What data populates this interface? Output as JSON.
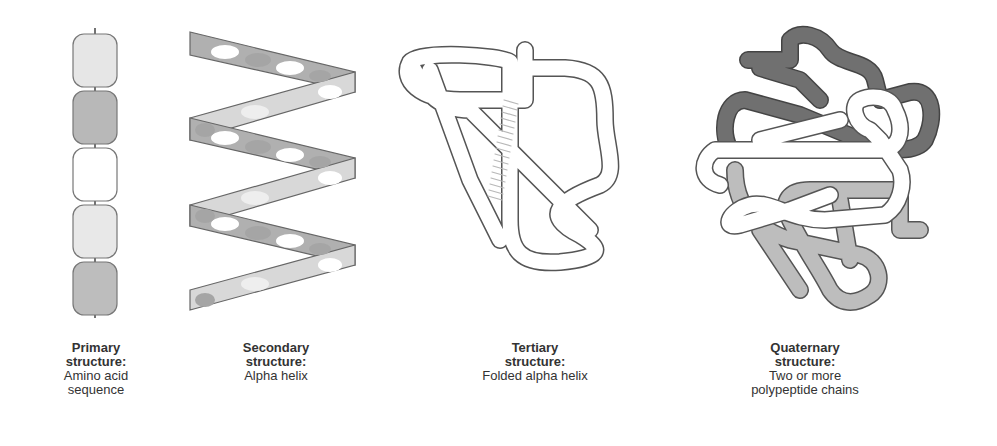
{
  "figure": {
    "panels": [
      {
        "id": "primary",
        "title_line1": "Primary",
        "title_line2": "structure:",
        "desc_line1": "Amino acid",
        "desc_line2": "sequence",
        "beads": [
          "#e6e6e6",
          "#b8b8b8",
          "#ffffff",
          "#e8e8e8",
          "#bdbdbd"
        ]
      },
      {
        "id": "secondary",
        "title_line1": "Secondary",
        "title_line2": "structure:",
        "desc_line1": "Alpha helix",
        "desc_line2": ""
      },
      {
        "id": "tertiary",
        "title_line1": "Tertiary",
        "title_line2": "structure:",
        "desc_line1": "Folded alpha helix",
        "desc_line2": ""
      },
      {
        "id": "quaternary",
        "title_line1": "Quaternary",
        "title_line2": "structure:",
        "desc_line1": "Two or more",
        "desc_line2": "polypeptide chains",
        "chain_colors": [
          "#6e6e6e",
          "#ffffff",
          "#bdbdbd"
        ]
      }
    ],
    "colors": {
      "outline": "#555555",
      "dark": "#8a8a8a",
      "mid": "#b5b5b5",
      "light": "#e6e6e6",
      "text": "#333333"
    }
  }
}
